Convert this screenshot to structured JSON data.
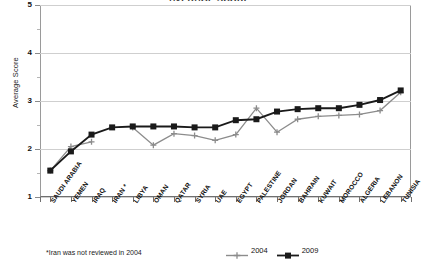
{
  "chart_data": {
    "type": "line",
    "title": "AVERAGE SCORE",
    "xlabel": "",
    "ylabel": "Average Score",
    "ylim": [
      1,
      5
    ],
    "yticks": [
      1,
      2,
      3,
      4,
      5
    ],
    "yticks_minor": [
      1.5,
      2.5,
      3.5,
      4.5
    ],
    "grid": true,
    "legend_position": "bottom-right",
    "categories": [
      "SAUDI ARABIA",
      "YEMEN",
      "IRAQ",
      "IRAN *",
      "LIBYA",
      "OMAN",
      "QATAR",
      "SYRIA",
      "UAE",
      "EGYPT",
      "PALESTINE",
      "JORDAN",
      "BAHRAIN",
      "KUWAIT",
      "MOROCCO",
      "ALGERIA",
      "LEBANON",
      "TUNISIA"
    ],
    "series": [
      {
        "name": "2004",
        "color": "#8c8c8c",
        "marker": "plus",
        "values": [
          1.55,
          2.05,
          2.15,
          null,
          2.45,
          2.08,
          2.32,
          2.28,
          2.18,
          2.3,
          2.85,
          2.35,
          2.62,
          2.68,
          2.7,
          2.72,
          2.8,
          3.18
        ]
      },
      {
        "name": "2009",
        "color": "#1a1a1a",
        "marker": "square",
        "values": [
          1.55,
          1.95,
          2.3,
          2.45,
          2.47,
          2.47,
          2.47,
          2.45,
          2.45,
          2.6,
          2.62,
          2.78,
          2.83,
          2.85,
          2.85,
          2.92,
          3.02,
          3.22
        ]
      }
    ],
    "annotations": [
      "*Iran was not reviewed in 2004"
    ]
  },
  "footnote": "*Iran was not reviewed in 2004",
  "legend": [
    {
      "label": "2004"
    },
    {
      "label": "2009"
    }
  ]
}
